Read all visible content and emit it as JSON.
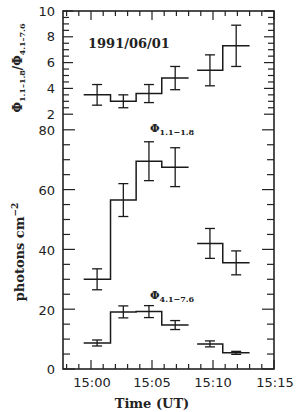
{
  "chart_data": [
    {
      "type": "line",
      "subtype": "step-histogram-with-error-bars",
      "panel": "upper",
      "title": "1991/06/01",
      "xlabel": "Time (UT)",
      "ylabel": "Φ1.1-1.8/Φ4.1-7.6",
      "xlim": [
        "14:57.7",
        "15:15"
      ],
      "ylim": [
        2,
        10
      ],
      "yticks": [
        2,
        4,
        6,
        8,
        10
      ],
      "grid": false,
      "series": [
        {
          "name": "Φ1.1-1.8/Φ4.1-7.6",
          "bins": [
            {
              "t_start": -0.6,
              "t_end": 1.6,
              "value": 3.5,
              "err": 0.8
            },
            {
              "t_start": 1.6,
              "t_end": 3.7,
              "value": 3.0,
              "err": 0.5
            },
            {
              "t_start": 3.7,
              "t_end": 5.8,
              "value": 3.6,
              "err": 0.7
            },
            {
              "t_start": 5.8,
              "t_end": 8.0,
              "value": 4.8,
              "err": 0.9
            },
            {
              "t_start": 8.7,
              "t_end": 10.8,
              "value": 5.4,
              "err": 1.2
            },
            {
              "t_start": 10.8,
              "t_end": 13.0,
              "value": 7.3,
              "err": 1.6
            }
          ]
        }
      ]
    },
    {
      "type": "line",
      "subtype": "step-histogram-with-error-bars",
      "panel": "lower",
      "xlabel": "Time (UT)",
      "ylabel": "photons cm-2",
      "xlim": [
        "14:57.7",
        "15:15"
      ],
      "xticks": [
        "15:00",
        "15:05",
        "15:10",
        "15:15"
      ],
      "ylim": [
        0,
        80
      ],
      "yticks": [
        0,
        20,
        40,
        60,
        80
      ],
      "grid": false,
      "series": [
        {
          "name": "Φ1.1-1.8",
          "bins": [
            {
              "t_start": -0.6,
              "t_end": 1.6,
              "value": 30,
              "err": 3.5
            },
            {
              "t_start": 1.6,
              "t_end": 3.7,
              "value": 56.5,
              "err": 5.5
            },
            {
              "t_start": 3.7,
              "t_end": 5.8,
              "value": 69.5,
              "err": 6.5
            },
            {
              "t_start": 5.8,
              "t_end": 8.0,
              "value": 67.5,
              "err": 6.5
            },
            {
              "t_start": 8.7,
              "t_end": 10.8,
              "value": 42,
              "err": 5
            },
            {
              "t_start": 10.8,
              "t_end": 13.0,
              "value": 35.5,
              "err": 4
            }
          ]
        },
        {
          "name": "Φ4.1-7.6",
          "bins": [
            {
              "t_start": -0.6,
              "t_end": 1.6,
              "value": 8.7,
              "err": 1
            },
            {
              "t_start": 1.6,
              "t_end": 3.7,
              "value": 19.1,
              "err": 2
            },
            {
              "t_start": 3.7,
              "t_end": 5.8,
              "value": 19.2,
              "err": 2
            },
            {
              "t_start": 5.8,
              "t_end": 8.0,
              "value": 14.7,
              "err": 1.5
            },
            {
              "t_start": 8.7,
              "t_end": 10.8,
              "value": 8.4,
              "err": 1
            },
            {
              "t_start": 10.8,
              "t_end": 13.0,
              "value": 5.4,
              "err": 0.5
            }
          ]
        }
      ]
    }
  ],
  "labels": {
    "date": "1991/06/01",
    "upper_ylabel_main": "Φ",
    "upper_ylabel_sub1": "1.1–1.8",
    "upper_ylabel_sep": "/",
    "upper_ylabel_sub2": "4.1–7.6",
    "lower_ylabel": "photons cm",
    "lower_ylabel_sup": "−2",
    "xlabel": "Time (UT)",
    "series1_name": "Φ",
    "series1_sub": "1.1−1.8",
    "series2_name": "Φ",
    "series2_sub": "4.1−7.6",
    "xticks": [
      "15:00",
      "15:05",
      "15:10",
      "15:15"
    ],
    "upper_yticks": [
      "10",
      "8",
      "6",
      "4",
      "2"
    ],
    "lower_yticks": [
      "80",
      "60",
      "40",
      "20",
      "0"
    ]
  }
}
